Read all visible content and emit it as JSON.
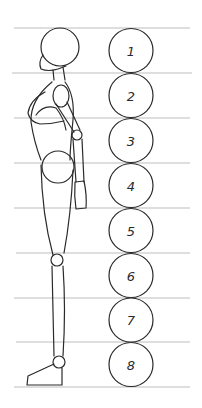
{
  "diagram": {
    "unit_label": "head",
    "head_units": [
      "1",
      "2",
      "3",
      "4",
      "5",
      "6",
      "7",
      "8"
    ],
    "guide_lines_y": [
      28,
      73,
      118,
      163,
      208,
      253,
      298,
      342,
      387
    ],
    "colors": {
      "ink": "#2a2a2a",
      "guide": "#bdbdbd",
      "background": "#ffffff"
    }
  }
}
